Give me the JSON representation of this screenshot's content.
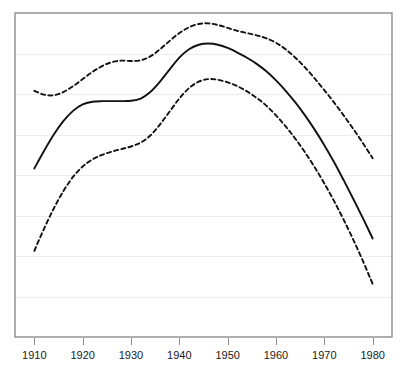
{
  "chart_data": {
    "type": "line",
    "title": "",
    "subtitle": "",
    "xlabel": "",
    "ylabel": "",
    "grid": true,
    "gridlines_horizontal": 7,
    "legend": "none",
    "xlim": [
      1906,
      1984
    ],
    "ylim": [
      0,
      100
    ],
    "x_tick_labels": [
      "1910",
      "1920",
      "1930",
      "1940",
      "1950",
      "1960",
      "1970",
      "1980"
    ],
    "x_ticks": [
      1910,
      1920,
      1930,
      1940,
      1950,
      1960,
      1970,
      1980
    ],
    "y_tick_labels": [],
    "y_ticks": [],
    "x": [
      1910,
      1912,
      1914,
      1916,
      1918,
      1920,
      1922,
      1924,
      1926,
      1928,
      1930,
      1932,
      1934,
      1936,
      1938,
      1940,
      1942,
      1944,
      1946,
      1948,
      1950,
      1952,
      1954,
      1956,
      1958,
      1960,
      1962,
      1964,
      1966,
      1968,
      1970,
      1972,
      1974,
      1976,
      1978,
      1980
    ],
    "series": [
      {
        "name": "upper-band",
        "style": "dashed",
        "color": "#111111",
        "values": [
          76.0,
          74.8,
          74.6,
          75.6,
          77.4,
          79.6,
          81.8,
          83.6,
          84.8,
          85.3,
          85.2,
          85.4,
          86.6,
          88.8,
          91.4,
          93.8,
          95.6,
          96.6,
          96.8,
          96.3,
          95.4,
          94.5,
          93.8,
          93.1,
          92.2,
          90.8,
          88.8,
          86.2,
          83.2,
          79.8,
          76.2,
          72.4,
          68.4,
          64.2,
          59.8,
          55.2
        ]
      },
      {
        "name": "central-estimate",
        "style": "solid",
        "color": "#111111",
        "values": [
          52.0,
          57.4,
          62.4,
          66.6,
          69.8,
          71.8,
          72.6,
          72.8,
          72.8,
          72.8,
          72.9,
          73.6,
          75.6,
          78.8,
          82.6,
          86.2,
          88.8,
          90.2,
          90.6,
          90.2,
          89.2,
          87.8,
          86.2,
          84.3,
          82.0,
          79.2,
          76.0,
          72.4,
          68.4,
          64.0,
          59.2,
          54.0,
          48.4,
          42.6,
          36.6,
          30.4
        ]
      },
      {
        "name": "lower-band",
        "style": "dashed",
        "color": "#111111",
        "values": [
          26.6,
          33.4,
          39.6,
          45.0,
          49.4,
          52.6,
          54.8,
          56.2,
          57.2,
          58.0,
          58.8,
          60.0,
          62.2,
          65.6,
          69.6,
          73.6,
          76.8,
          78.8,
          79.6,
          79.4,
          78.6,
          77.4,
          75.8,
          73.8,
          71.4,
          68.4,
          65.0,
          61.2,
          57.0,
          52.4,
          47.4,
          42.0,
          36.2,
          30.0,
          23.4,
          16.4
        ]
      }
    ]
  },
  "axis": {
    "tick_label_0": "1910",
    "tick_label_1": "1920",
    "tick_label_2": "1930",
    "tick_label_3": "1940",
    "tick_label_4": "1950",
    "tick_label_5": "1960",
    "tick_label_6": "1970",
    "tick_label_7": "1980"
  },
  "colors": {
    "line": "#111111",
    "frame": "#8c8c8c",
    "grid": "#ececed",
    "background": "#ffffff",
    "tick_text": "#1a1a1a"
  }
}
